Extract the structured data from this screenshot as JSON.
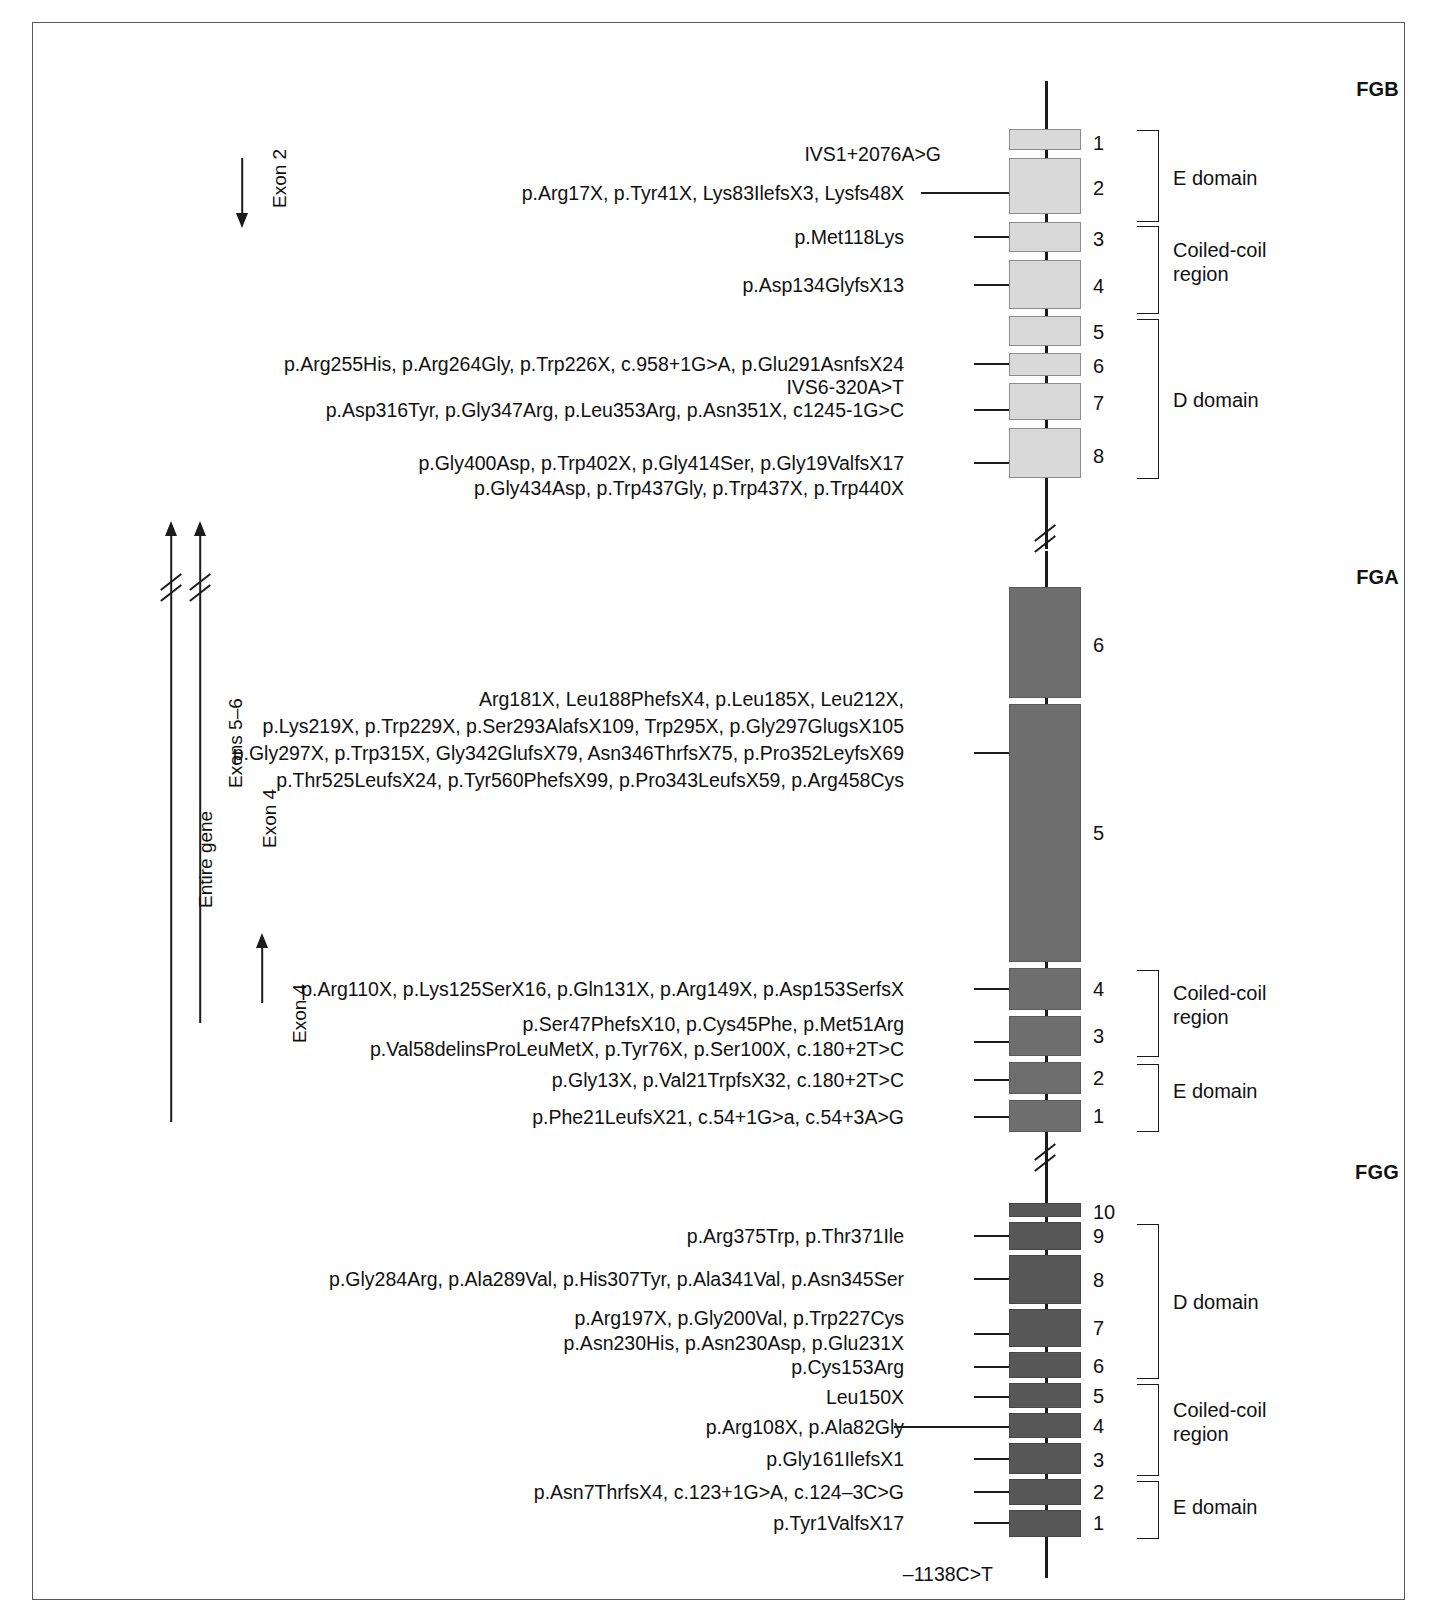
{
  "figure": {
    "genes": [
      {
        "id": "FGB",
        "title": "FGB",
        "exon_numbers": [
          "1",
          "2",
          "3",
          "4",
          "5",
          "6",
          "7",
          "8"
        ],
        "domains": [
          {
            "label": "E domain"
          },
          {
            "label": "Coiled-coil\nregion"
          },
          {
            "label": "D domain"
          }
        ],
        "mutations": [
          "IVS1+2076A>G",
          "p.Arg17X, p.Tyr41X, Lys83IlefsX3, Lysfs48X",
          "p.Met118Lys",
          "p.Asp134GlyfsX13",
          "p.Arg255His, p.Arg264Gly, p.Trp226X, c.958+1G>A, p.Glu291AsnfsX24",
          "IVS6-320A>T",
          "p.Asp316Tyr, p.Gly347Arg, p.Leu353Arg, p.Asn351X, c1245-1G>C",
          "p.Gly400Asp, p.Trp402X, p.Gly414Ser, p.Gly19ValfsX17",
          "p.Gly434Asp, p.Trp437Gly, p.Trp437X, p.Trp440X"
        ]
      },
      {
        "id": "FGA",
        "title": "FGA",
        "exon_numbers": [
          "6",
          "5",
          "4",
          "3",
          "2",
          "1"
        ],
        "domains": [
          {
            "label": "Coiled-coil\nregion"
          },
          {
            "label": "E domain"
          }
        ],
        "mutations": [
          "Arg181X, Leu188PhefsX4, p.Leu185X, Leu212X,",
          "p.Lys219X, p.Trp229X, p.Ser293AlafsX109, Trp295X, p.Gly297GlugsX105",
          "p.Gly297X, p.Trp315X, Gly342GlufsX79, Asn346ThrfsX75, p.Pro352LeyfsX69",
          "p.Thr525LeufsX24, p.Tyr560PhefsX99, p.Pro343LeufsX59, p.Arg458Cys",
          "p.Arg110X, p.Lys125SerX16, p.Gln131X, p.Arg149X, p.Asp153SerfsX",
          "p.Ser47PhefsX10, p.Cys45Phe, p.Met51Arg",
          "p.Val58delinsProLeuMetX, p.Tyr76X, p.Ser100X, c.180+2T>C",
          "p.Gly13X, p.Val21TrpfsX32, c.180+2T>C",
          "p.Phe21LeufsX21, c.54+1G>a, c.54+3A>G"
        ]
      },
      {
        "id": "FGG",
        "title": "FGG",
        "exon_numbers": [
          "10",
          "9",
          "8",
          "7",
          "6",
          "5",
          "4",
          "3",
          "2",
          "1"
        ],
        "domains": [
          {
            "label": "D domain"
          },
          {
            "label": "Coiled-coil\nregion"
          },
          {
            "label": "E domain"
          }
        ],
        "mutations": [
          "p.Arg375Trp, p.Thr371Ile",
          "p.Gly284Arg, p.Ala289Val, p.His307Tyr, p.Ala341Val, p.Asn345Ser",
          "p.Arg197X, p.Gly200Val, p.Trp227Cys",
          "p.Asn230His, p.Asn230Asp, p.Glu231X",
          "p.Cys153Arg",
          "Leu150X",
          "p.Arg108X, p.Ala82Gly",
          "p.Gly161IlefsX1",
          "p.Asn7ThrfsX4, c.123+1G>A, c.124–3C>G",
          "p.Tyr1ValfsX17"
        ],
        "promoter_mutation": "–1138C>T"
      }
    ],
    "arrows": [
      {
        "label": "Exon 2",
        "direction": "down"
      },
      {
        "label": "Entire gene",
        "direction": "up"
      },
      {
        "label": "Exons 5–6",
        "direction": "up"
      },
      {
        "label": "Exon 4",
        "direction": "up"
      },
      {
        "label": "Exon 4",
        "direction": "up"
      }
    ],
    "colors": {
      "fgb_exon": "#d9d9d9",
      "fga_exon": "#6e6e6e",
      "fgg_exon": "#575757",
      "line": "#1b1b1b",
      "border": "#5a5a5a"
    }
  }
}
